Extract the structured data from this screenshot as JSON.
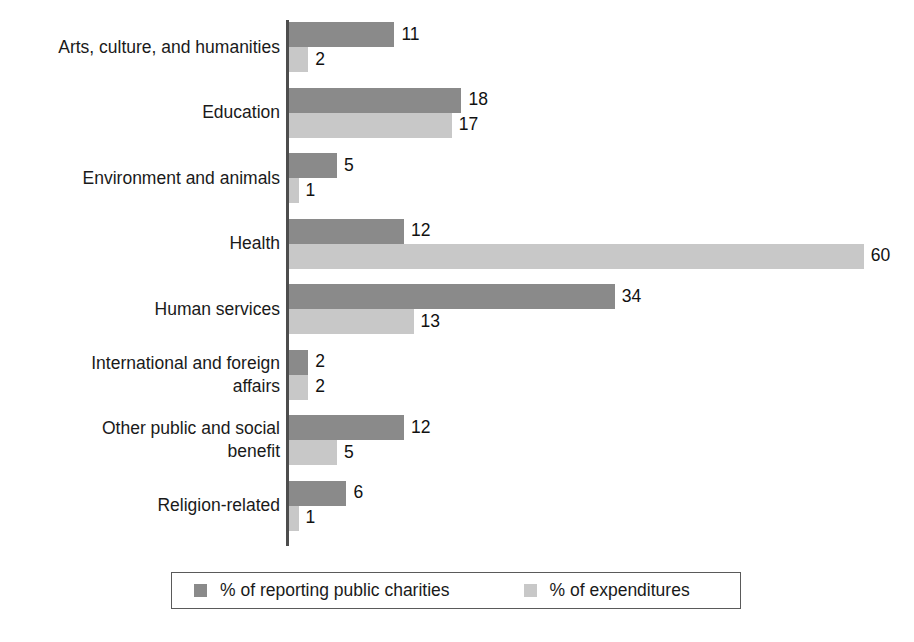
{
  "chart_data": {
    "type": "bar",
    "orientation": "horizontal",
    "title": "",
    "subtitle": "",
    "xlabel": "",
    "ylabel": "",
    "grid": false,
    "legend_position": "bottom",
    "xlim": [
      0,
      60
    ],
    "categories": [
      "Arts, culture, and humanities",
      "Education",
      "Environment and animals",
      "Health",
      "Human services",
      "International and foreign\naffairs",
      "Other public and social\nbenefit",
      "Religion-related"
    ],
    "series": [
      {
        "name": "% of reporting public charities",
        "color": "#8a8a8a",
        "values": [
          11,
          18,
          5,
          12,
          34,
          2,
          12,
          6
        ]
      },
      {
        "name": "% of expenditures",
        "color": "#c8c8c8",
        "values": [
          2,
          17,
          1,
          60,
          13,
          2,
          5,
          1
        ]
      }
    ]
  },
  "legend": {
    "items": [
      {
        "label": "% of reporting public charities",
        "color": "#8a8a8a"
      },
      {
        "label": "% of expenditures",
        "color": "#c8c8c8"
      }
    ]
  },
  "axis": {
    "line_color": "#4d4d4d"
  }
}
